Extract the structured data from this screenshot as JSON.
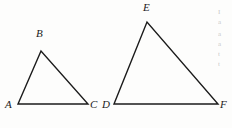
{
  "figure": {
    "background_color": "#fdfdfc",
    "stroke_color": "#1b1b1b",
    "stroke_width": 1.4,
    "label_color": "#1b1b1b"
  },
  "triangles": [
    {
      "name": "triangle-abc",
      "vertices": [
        {
          "label": "A",
          "x": 18,
          "y": 104,
          "label_x": 5,
          "label_y": 99
        },
        {
          "label": "B",
          "x": 41,
          "y": 51,
          "label_x": 36,
          "label_y": 28
        },
        {
          "label": "C",
          "x": 88,
          "y": 104,
          "label_x": 90,
          "label_y": 99
        }
      ],
      "points_attr": "18,104 41,51 88,104"
    },
    {
      "name": "triangle-def",
      "vertices": [
        {
          "label": "D",
          "x": 114,
          "y": 104,
          "label_x": 102,
          "label_y": 99
        },
        {
          "label": "E",
          "x": 147,
          "y": 22,
          "label_x": 143,
          "label_y": 2
        },
        {
          "label": "F",
          "x": 218,
          "y": 104,
          "label_x": 220,
          "label_y": 99
        }
      ],
      "points_attr": "114,104 147,22 218,104"
    }
  ],
  "margin_text": {
    "lines": [
      "I",
      "a",
      "a",
      "a",
      "t",
      "t"
    ]
  }
}
